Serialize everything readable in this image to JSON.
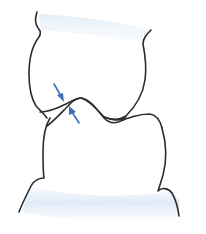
{
  "figure": {
    "title": "",
    "colors": {
      "outline": "#2b2b2b",
      "arrow": "#3d6fb6",
      "gingiva_shade": "#cfe3f3",
      "background": "#ffffff"
    },
    "elements": [
      {
        "name": "upper-tooth",
        "label": ""
      },
      {
        "name": "lower-tooth",
        "label": ""
      },
      {
        "name": "contact-arrow-upper",
        "direction": "down-right"
      },
      {
        "name": "contact-arrow-lower",
        "direction": "up-left"
      }
    ]
  }
}
